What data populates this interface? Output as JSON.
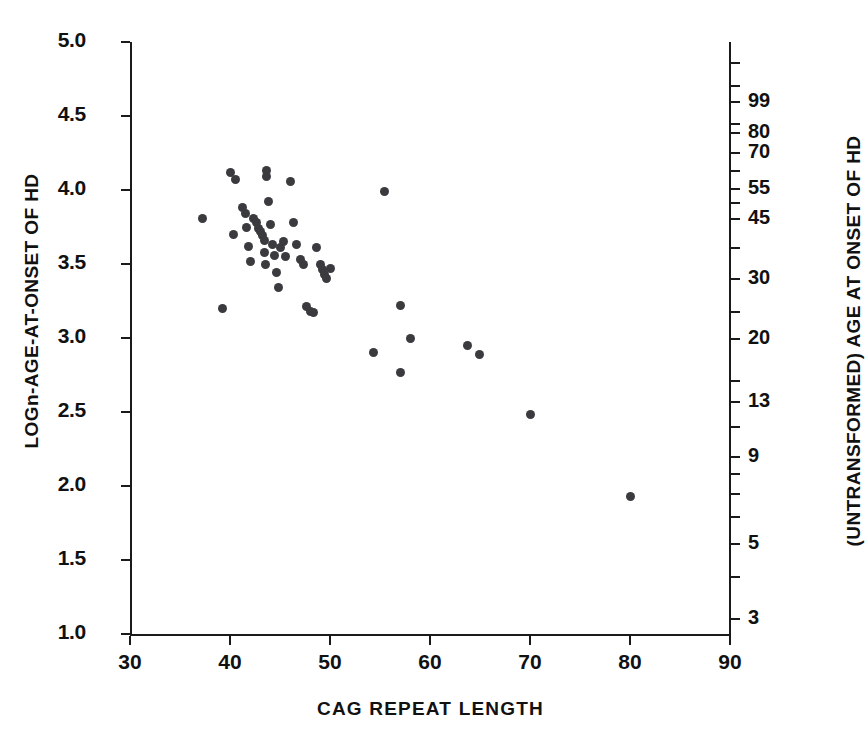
{
  "chart_data": {
    "type": "scatter",
    "title": "",
    "xlabel": "CAG REPEAT LENGTH",
    "ylabel": "LOGn-AGE-AT-ONSET OF HD",
    "ylabel_right": "(UNTRANSFORMED) AGE AT ONSET OF HD",
    "xlim": [
      30,
      90
    ],
    "ylim": [
      1.0,
      5.0
    ],
    "grid": false,
    "legend": null,
    "marker_color": "#3b3b3f",
    "axis_color": "#1a1a1a",
    "background": "#ffffff",
    "xticks": [
      30,
      40,
      50,
      60,
      70,
      80,
      90
    ],
    "xticklabels": [
      "30",
      "40",
      "50",
      "60",
      "70",
      "80",
      "90"
    ],
    "yticks_left": [
      1.0,
      1.5,
      2.0,
      2.5,
      3.0,
      3.5,
      4.0,
      4.5,
      5.0
    ],
    "yticklabels_left": [
      "1.0",
      "1.5",
      "2.0",
      "2.5",
      "3.0",
      "3.5",
      "4.0",
      "4.5",
      "5.0"
    ],
    "yticks_right_values": [
      3,
      5,
      9,
      13,
      20,
      30,
      45,
      55,
      70,
      80,
      99
    ],
    "yticklabels_right": [
      "3",
      "5",
      "9",
      "13",
      "20",
      "30",
      "45",
      "55",
      "70",
      "80",
      "99"
    ],
    "yticks_right_log": [
      1.099,
      1.609,
      2.197,
      2.565,
      2.996,
      3.401,
      3.807,
      4.007,
      4.248,
      4.382,
      4.595
    ],
    "yticks_right_unlabeled_log": [
      1.386,
      1.792,
      1.946,
      2.079,
      2.398,
      2.708,
      3.178,
      3.611,
      3.912,
      4.127,
      4.443,
      4.7,
      4.86
    ],
    "x": [
      37.2,
      39.2,
      40.0,
      40.3,
      40.5,
      41.2,
      41.5,
      41.6,
      41.8,
      42.0,
      42.3,
      42.6,
      42.8,
      43.0,
      43.2,
      43.4,
      43.4,
      43.5,
      43.6,
      43.6,
      43.8,
      44.0,
      44.2,
      44.4,
      44.6,
      44.8,
      45.0,
      45.3,
      45.5,
      46.0,
      46.3,
      46.6,
      47.0,
      47.3,
      47.6,
      48.0,
      48.3,
      48.6,
      49.0,
      49.2,
      49.4,
      49.6,
      50.0,
      54.3,
      55.4,
      57.0,
      57.0,
      58.0,
      63.7,
      64.9,
      70.0,
      80.0
    ],
    "y": [
      3.81,
      3.2,
      4.12,
      3.7,
      4.07,
      3.88,
      3.84,
      3.75,
      3.62,
      3.52,
      3.81,
      3.78,
      3.74,
      3.72,
      3.69,
      3.66,
      3.58,
      3.5,
      4.13,
      4.09,
      3.92,
      3.77,
      3.63,
      3.56,
      3.44,
      3.34,
      3.61,
      3.65,
      3.55,
      4.06,
      3.78,
      3.63,
      3.53,
      3.5,
      3.21,
      3.18,
      3.17,
      3.61,
      3.5,
      3.46,
      3.43,
      3.4,
      3.47,
      2.9,
      3.99,
      3.22,
      2.77,
      3.0,
      2.95,
      2.89,
      2.48,
      1.93
    ]
  },
  "axes": {
    "left_title": "LOGn-AGE-AT-ONSET OF HD",
    "right_title": "(UNTRANSFORMED) AGE AT ONSET OF HD",
    "bottom_title": "CAG REPEAT LENGTH"
  }
}
